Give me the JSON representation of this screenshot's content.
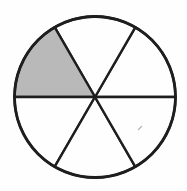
{
  "figure": {
    "type": "fraction-circle",
    "total_sectors": 6,
    "shaded_count": 1,
    "fraction_shaded": "1/6",
    "sectors": [
      {
        "start_deg": 0,
        "end_deg": 60,
        "shaded": false
      },
      {
        "start_deg": 60,
        "end_deg": 120,
        "shaded": false
      },
      {
        "start_deg": 120,
        "end_deg": 180,
        "shaded": true
      },
      {
        "start_deg": 180,
        "end_deg": 240,
        "shaded": false
      },
      {
        "start_deg": 240,
        "end_deg": 300,
        "shaded": false
      },
      {
        "start_deg": 300,
        "end_deg": 360,
        "shaded": false
      }
    ],
    "geometry": {
      "canvas_width": 187,
      "canvas_height": 191,
      "center_x": 95,
      "center_y": 97,
      "radius": 80.5,
      "outline_width": 2.8,
      "spoke_width": 2.4
    },
    "colors": {
      "background": "#fefefe",
      "line": "#1e1e1e",
      "shaded_fill": "#b9b9b9",
      "unshaded_fill": "#fefefe",
      "artifact": "#9a9a9a"
    },
    "artifact": {
      "x1": 138.5,
      "y1": 129.5,
      "x2": 141.5,
      "y2": 126.5
    }
  }
}
